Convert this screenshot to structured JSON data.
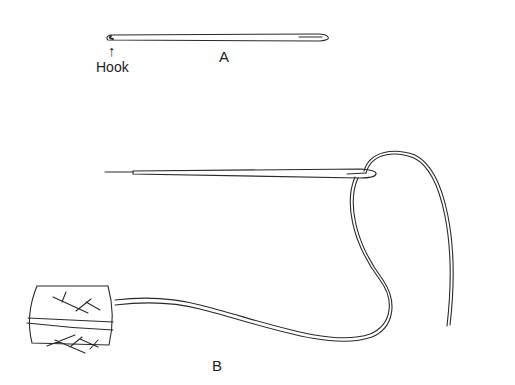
{
  "diagram": {
    "labels": {
      "hook": "Hook",
      "arrow": "↑",
      "a": "A",
      "b": "B"
    },
    "line_color": "#2a2a2a",
    "background": "#ffffff"
  }
}
